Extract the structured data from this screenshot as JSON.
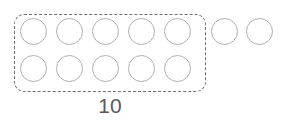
{
  "canvas": {
    "width": 285,
    "height": 124,
    "background": "#ffffff"
  },
  "diagram": {
    "type": "ten-frame-counting",
    "total_counters": 12,
    "counters_inside_group": 10,
    "counters_outside_group": 2,
    "rows_inside_group": 2,
    "columns_inside_group": 5
  },
  "group_box": {
    "label": "10",
    "label_text": "10",
    "border_color": "#6e6e6e",
    "border_width": 1.4,
    "border_radius": 10,
    "dash": "5px 3px",
    "x": 14,
    "y": 14,
    "width": 192,
    "height": 78
  },
  "label_style": {
    "color": "#5a5a5a",
    "font_size": 21,
    "x": 14,
    "y": 95,
    "width": 192
  },
  "counter_style": {
    "diameter": 27,
    "stroke_color": "#b0b0b0",
    "stroke_width": 1.6
  },
  "counters": [
    {
      "id": "counter-1",
      "group": "inside",
      "row": 1,
      "col": 1,
      "x": 20,
      "y": 18
    },
    {
      "id": "counter-2",
      "group": "inside",
      "row": 1,
      "col": 2,
      "x": 56,
      "y": 18
    },
    {
      "id": "counter-3",
      "group": "inside",
      "row": 1,
      "col": 3,
      "x": 92,
      "y": 18
    },
    {
      "id": "counter-4",
      "group": "inside",
      "row": 1,
      "col": 4,
      "x": 128,
      "y": 18
    },
    {
      "id": "counter-5",
      "group": "inside",
      "row": 1,
      "col": 5,
      "x": 164,
      "y": 18
    },
    {
      "id": "counter-6",
      "group": "inside",
      "row": 2,
      "col": 1,
      "x": 20,
      "y": 55
    },
    {
      "id": "counter-7",
      "group": "inside",
      "row": 2,
      "col": 2,
      "x": 56,
      "y": 55
    },
    {
      "id": "counter-8",
      "group": "inside",
      "row": 2,
      "col": 3,
      "x": 92,
      "y": 55
    },
    {
      "id": "counter-9",
      "group": "inside",
      "row": 2,
      "col": 4,
      "x": 128,
      "y": 55
    },
    {
      "id": "counter-10",
      "group": "inside",
      "row": 2,
      "col": 5,
      "x": 164,
      "y": 55
    },
    {
      "id": "counter-11",
      "group": "outside",
      "row": 1,
      "col": 6,
      "x": 211,
      "y": 18
    },
    {
      "id": "counter-12",
      "group": "outside",
      "row": 1,
      "col": 7,
      "x": 246,
      "y": 18
    }
  ]
}
